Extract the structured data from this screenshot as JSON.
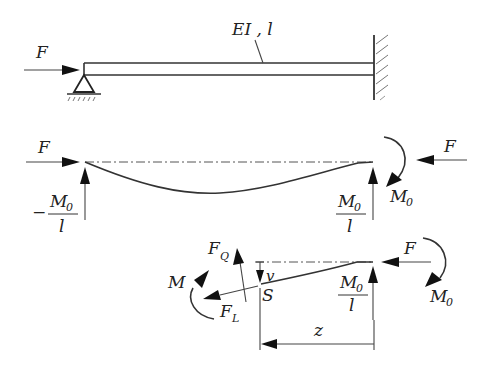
{
  "figure": {
    "top": {
      "force_label": "F",
      "beam_label": "EI , l"
    },
    "middle": {
      "left_force_label": "F",
      "left_reaction_sign": "−",
      "left_reaction_num": "M",
      "left_reaction_num_sub": "0",
      "left_reaction_den": "l",
      "right_reaction_num": "M",
      "right_reaction_num_sub": "0",
      "right_reaction_den": "l",
      "moment_label": "M",
      "moment_label_sub": "0",
      "right_force_label": "F"
    },
    "bottom": {
      "shear_label": "F",
      "shear_label_sub": "Q",
      "normal_label": "F",
      "normal_label_sub": "L",
      "moment_label": "M",
      "deflection_label": "v",
      "section_label": "S",
      "reaction_num": "M",
      "reaction_num_sub": "0",
      "reaction_den": "l",
      "force_label": "F",
      "moment0_label": "M",
      "moment0_label_sub": "0",
      "dimension_label": "z"
    }
  }
}
